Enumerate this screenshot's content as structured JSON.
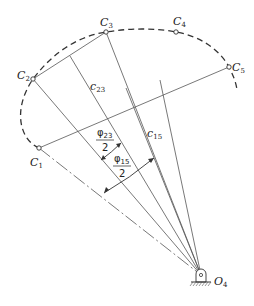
{
  "diagram": {
    "points": [
      {
        "id": "C1",
        "base": "C",
        "sub": "1"
      },
      {
        "id": "C2",
        "base": "C",
        "sub": "2"
      },
      {
        "id": "C3",
        "base": "C",
        "sub": "3"
      },
      {
        "id": "C4",
        "base": "C",
        "sub": "4"
      },
      {
        "id": "C5",
        "base": "C",
        "sub": "5"
      }
    ],
    "pivot": {
      "base": "O",
      "sub": "4"
    },
    "chord_labels": [
      {
        "base": "c",
        "sub": "23"
      },
      {
        "base": "c",
        "sub": "15"
      }
    ],
    "angle_labels": [
      {
        "num_base": "φ",
        "num_sub": "23",
        "den": "2"
      },
      {
        "num_base": "φ",
        "num_sub": "15",
        "den": "2"
      }
    ],
    "colors": {
      "line": "#555555",
      "text": "#222222",
      "background": "#ffffff"
    }
  }
}
